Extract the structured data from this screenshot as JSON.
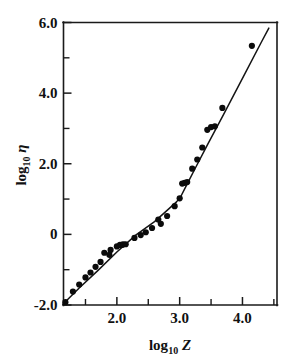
{
  "chart_data": {
    "type": "scatter",
    "title": "",
    "xlabel": "log10 Z",
    "ylabel": "log10 η",
    "xlabel_base": "log",
    "xlabel_sub": "10",
    "xlabel_var": "Z",
    "ylabel_base": "log",
    "ylabel_sub": "10",
    "ylabel_var": "η",
    "xlim": [
      1.15,
      4.55
    ],
    "ylim": [
      -2.0,
      6.0
    ],
    "grid": false,
    "legend": "none",
    "x_major_ticks": [
      2.0,
      3.0,
      4.0
    ],
    "x_major_tick_labels": [
      "2.0",
      "3.0",
      "4.0"
    ],
    "x_minor_ticks": [
      1.5,
      2.5,
      3.5,
      4.5
    ],
    "y_major_ticks": [
      -2.0,
      0.0,
      2.0,
      4.0,
      6.0
    ],
    "y_major_tick_labels": [
      "-2.0",
      "0",
      "2.0",
      "4.0",
      "6.0"
    ],
    "y_minor_ticks": [
      -1.0,
      1.0,
      3.0,
      5.0
    ],
    "marker": "filled-circle",
    "marker_color": "#0b0b0b",
    "line_color": "#141414",
    "series": [
      {
        "name": "measured viscosity",
        "x": [
          1.18,
          1.3,
          1.4,
          1.5,
          1.58,
          1.66,
          1.74,
          1.8,
          1.88,
          1.9,
          2.0,
          2.05,
          2.08,
          2.1,
          2.14,
          2.28,
          2.38,
          2.46,
          2.56,
          2.66,
          2.7,
          2.8,
          2.92,
          3.0,
          3.04,
          3.08,
          3.12,
          3.2,
          3.28,
          3.36,
          3.44,
          3.5,
          3.56,
          3.68,
          4.15
        ],
        "y": [
          -1.92,
          -1.62,
          -1.42,
          -1.22,
          -1.08,
          -0.92,
          -0.78,
          -0.52,
          -0.58,
          -0.44,
          -0.34,
          -0.3,
          -0.3,
          -0.28,
          -0.28,
          -0.1,
          -0.02,
          0.06,
          0.18,
          0.42,
          0.3,
          0.52,
          0.8,
          1.02,
          1.44,
          1.46,
          1.48,
          1.86,
          2.12,
          2.46,
          2.96,
          3.04,
          3.06,
          3.58,
          5.34
        ]
      }
    ],
    "fit_line": {
      "name": "fitted curve",
      "x": [
        1.14,
        1.4,
        1.7,
        2.0,
        2.3,
        2.6,
        2.8,
        2.95,
        3.02,
        3.1,
        3.25,
        3.45,
        3.7,
        4.0,
        4.3,
        4.42
      ],
      "y": [
        -1.98,
        -1.52,
        -1.02,
        -0.5,
        -0.02,
        0.36,
        0.68,
        0.92,
        1.08,
        1.36,
        1.88,
        2.56,
        3.4,
        4.42,
        5.44,
        5.84
      ]
    }
  }
}
